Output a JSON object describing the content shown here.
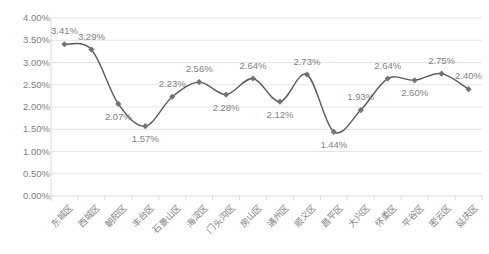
{
  "chart_data": {
    "type": "line",
    "title": "",
    "subtitle": "",
    "xlabel": "",
    "ylabel": "",
    "ylim": [
      0,
      4
    ],
    "grid": true,
    "legend": false,
    "y_tick_labels": [
      "4.00%",
      "3.50%",
      "3.00%",
      "2.50%",
      "2.00%",
      "1.50%",
      "1.00%",
      "0.50%",
      "0.00%"
    ],
    "y_tick_values": [
      4.0,
      3.5,
      3.0,
      2.5,
      2.0,
      1.5,
      1.0,
      0.5,
      0.0
    ],
    "categories": [
      "东城区",
      "西城区",
      "朝阳区",
      "丰台区",
      "石景山区",
      "海淀区",
      "门头沟区",
      "房山区",
      "通州区",
      "顺义区",
      "昌平区",
      "大兴区",
      "怀柔区",
      "平谷区",
      "密云区",
      "延庆区"
    ],
    "values": [
      3.41,
      3.29,
      2.07,
      1.57,
      2.23,
      2.56,
      2.28,
      2.64,
      2.12,
      2.73,
      1.44,
      1.93,
      2.64,
      2.6,
      2.75,
      2.4
    ],
    "data_labels": [
      "3.41%",
      "3.29%",
      "2.07%",
      "1.57%",
      "2.23%",
      "2.56%",
      "2.28%",
      "2.64%",
      "2.12%",
      "2.73%",
      "1.44%",
      "1.93%",
      "2.64%",
      "2.60%",
      "2.75%",
      "2.40%"
    ],
    "label_positions": [
      "above",
      "above",
      "below",
      "below",
      "above",
      "above",
      "below",
      "above",
      "below",
      "above",
      "below",
      "above",
      "above",
      "below",
      "above",
      "above"
    ],
    "series": [
      {
        "name": "",
        "values": [
          3.41,
          3.29,
          2.07,
          1.57,
          2.23,
          2.56,
          2.28,
          2.64,
          2.12,
          2.73,
          1.44,
          1.93,
          2.64,
          2.6,
          2.75,
          2.4
        ],
        "color": "#5a5a5a",
        "marker": "diamond",
        "smooth": true
      }
    ],
    "colors": {
      "line": "#5a5a5a",
      "marker": "#737373",
      "grid": "#e4e4e4",
      "axis": "#d9d9d9",
      "tick_text": "#808080",
      "label_text": "#7f7f7f",
      "background": "#ffffff"
    }
  }
}
